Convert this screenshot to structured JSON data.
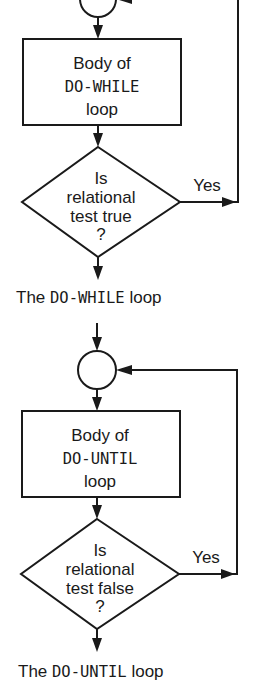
{
  "diagrams": [
    {
      "id": "do-while",
      "body": {
        "line1": "Body of",
        "line2": "DO-WHILE",
        "line3": "loop"
      },
      "decision": {
        "line1": "Is",
        "line2": "relational",
        "line3": "test true",
        "line4": "?"
      },
      "branch_label": "Yes",
      "caption": {
        "prefix": "The ",
        "keyword": "DO-WHILE",
        "suffix": " loop"
      }
    },
    {
      "id": "do-until",
      "body": {
        "line1": "Body of",
        "line2": "DO-UNTIL",
        "line3": "loop"
      },
      "decision": {
        "line1": "Is",
        "line2": "relational",
        "line3": "test false",
        "line4": "?"
      },
      "branch_label": "Yes",
      "caption": {
        "prefix": "The ",
        "keyword": "DO-UNTIL",
        "suffix": " loop"
      }
    }
  ],
  "colors": {
    "ink": "#1a1a1a",
    "background": "#ffffff"
  }
}
